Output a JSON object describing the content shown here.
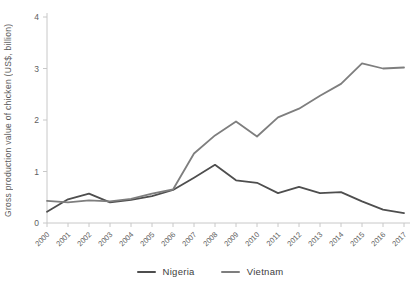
{
  "chart_data": {
    "type": "line",
    "title": "",
    "xlabel": "",
    "ylabel": "Gross production value of chicken (US$, billion)",
    "x": [
      2000,
      2001,
      2002,
      2003,
      2004,
      2005,
      2006,
      2007,
      2008,
      2009,
      2010,
      2011,
      2012,
      2013,
      2014,
      2015,
      2016,
      2017
    ],
    "series": [
      {
        "name": "Nigeria",
        "color": "#4e4e4e",
        "values": [
          0.22,
          0.46,
          0.57,
          0.4,
          0.45,
          0.52,
          0.64,
          0.88,
          1.13,
          0.83,
          0.78,
          0.58,
          0.7,
          0.58,
          0.6,
          0.42,
          0.26,
          0.19
        ]
      },
      {
        "name": "Vietnam",
        "color": "#7e7e7e",
        "values": [
          0.43,
          0.4,
          0.44,
          0.42,
          0.47,
          0.57,
          0.65,
          1.35,
          1.7,
          1.97,
          1.68,
          2.05,
          2.22,
          2.47,
          2.7,
          3.1,
          3.0,
          3.02
        ]
      }
    ],
    "ylim": [
      0,
      4
    ],
    "yticks": [
      0,
      1,
      2,
      3,
      4
    ],
    "grid": false,
    "legend_position": "bottom"
  },
  "colors": {
    "axis_line": "#c8c8c8",
    "tick_text": "#5e5e5e",
    "legend_text": "#3d3d3d"
  }
}
